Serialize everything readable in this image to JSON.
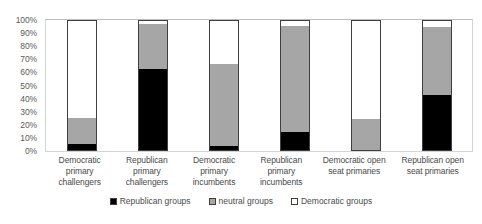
{
  "chart_data": {
    "type": "bar",
    "stacked": true,
    "stack_mode": "percent",
    "title": "",
    "xlabel": "",
    "ylabel": "",
    "ylim": [
      0,
      100
    ],
    "grid": false,
    "legend_position": "bottom",
    "categories": [
      "Democratic primary challengers",
      "Republican primary challengers",
      "Democratic primary incumbents",
      "Republican primary incumbents",
      "Democratic open seat primaries",
      "Republican open seat primaries"
    ],
    "category_lines": [
      [
        "Democratic",
        "primary",
        "challengers"
      ],
      [
        "Republican",
        "primary",
        "challengers"
      ],
      [
        "Democratic",
        "primary",
        "incumbents"
      ],
      [
        "Republican",
        "primary",
        "incumbents"
      ],
      [
        "Democratic open",
        "seat primaries"
      ],
      [
        "Republican open",
        "seat primaries"
      ]
    ],
    "ytick_labels": [
      "100%",
      "90%",
      "80%",
      "70%",
      "60%",
      "50%",
      "40%",
      "30%",
      "20%",
      "10%",
      "0%"
    ],
    "ytick_values": [
      100,
      90,
      80,
      70,
      60,
      50,
      40,
      30,
      20,
      10,
      0
    ],
    "series": [
      {
        "name": "Republican groups",
        "color": "#000000",
        "values": [
          5,
          63,
          3,
          14,
          0,
          43
        ]
      },
      {
        "name": "neutral groups",
        "color": "#a6a6a6",
        "values": [
          20,
          35,
          64,
          82,
          24,
          52
        ]
      },
      {
        "name": "Democratic groups",
        "color": "#ffffff",
        "values": [
          75,
          2,
          33,
          4,
          76,
          5
        ]
      }
    ]
  },
  "legend": {
    "items": [
      {
        "label": "Republican groups",
        "key": "rep"
      },
      {
        "label": "neutral groups",
        "key": "neu"
      },
      {
        "label": "Democratic groups",
        "key": "dem"
      }
    ]
  }
}
